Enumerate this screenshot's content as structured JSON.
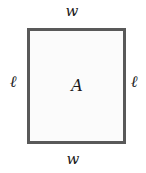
{
  "figure": {
    "type": "rectangle-dimension-diagram",
    "shape_name": "rectangle",
    "stroke_color": "#595959",
    "fill_color": "#fbfbfb",
    "background_color": "#ffffff",
    "label_color": "#1a1a1a"
  },
  "labels": {
    "width_top": "w",
    "width_bottom": "w",
    "length_left": "ℓ",
    "length_right": "ℓ",
    "area_center": "A"
  }
}
